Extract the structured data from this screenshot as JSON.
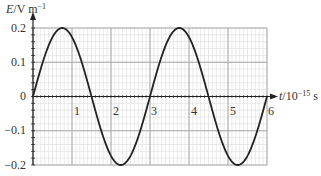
{
  "chart_data": {
    "type": "line",
    "title": "",
    "ylabel": "E/V m^-1",
    "ylabel_var": "E",
    "ylabel_unit": "/V m",
    "ylabel_exp": "−1",
    "xlabel": "t/10^-15 s",
    "xlabel_var": "t",
    "xlabel_unit": "/10",
    "xlabel_exp": "−15",
    "xlabel_suffix": " s",
    "xlim": [
      0,
      6
    ],
    "ylim": [
      -0.2,
      0.2
    ],
    "x_ticks": [
      "1",
      "2",
      "3",
      "4",
      "5",
      "6"
    ],
    "y_ticks": [
      "0.2",
      "0.1",
      "0",
      "−0.1",
      "−0.2"
    ],
    "grid": true,
    "series": [
      {
        "name": "E(t)",
        "amplitude": 0.2,
        "period": 3,
        "x": [
          0,
          0.375,
          0.75,
          1.125,
          1.5,
          1.875,
          2.25,
          2.625,
          3.0,
          3.375,
          3.75,
          4.125,
          4.5,
          4.875,
          5.25,
          5.625,
          6.0
        ],
        "values": [
          0,
          0.141,
          0.2,
          0.141,
          0,
          -0.141,
          -0.2,
          -0.141,
          0,
          0.141,
          0.2,
          0.141,
          0,
          -0.141,
          -0.2,
          -0.141,
          0
        ]
      }
    ],
    "colors": {
      "curve": "#222222",
      "grid_major": "#a8a8a8",
      "grid_minor": "#dcdcdc",
      "axis": "#222222"
    }
  }
}
